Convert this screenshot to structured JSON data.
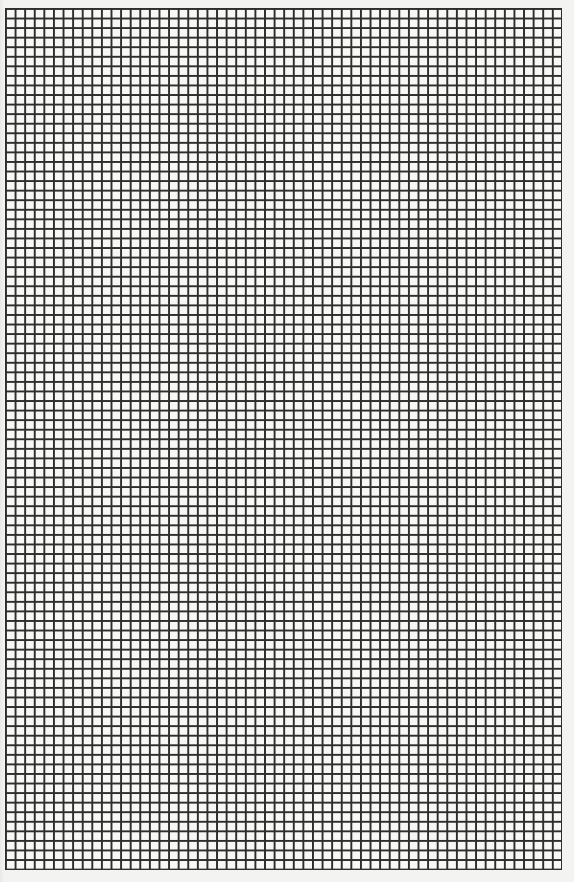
{
  "page": {
    "kind": "graph-paper-scan",
    "background_color": "#f3f3f1",
    "line_color": "#2e2e2e"
  },
  "grid": {
    "columns": 58,
    "rows": 90,
    "cell_size_px": 9.6,
    "origin": [
      5,
      8
    ],
    "extent": [
      561,
      869
    ]
  }
}
